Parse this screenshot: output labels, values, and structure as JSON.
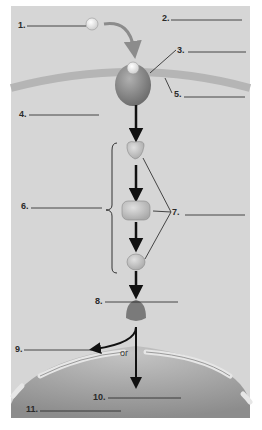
{
  "diagram": {
    "type": "cell signaling pathway worksheet",
    "labels": [
      {
        "num": "1.",
        "blank": ""
      },
      {
        "num": "2.",
        "blank": ""
      },
      {
        "num": "3.",
        "blank": ""
      },
      {
        "num": "4.",
        "blank": ""
      },
      {
        "num": "5.",
        "blank": ""
      },
      {
        "num": "6.",
        "blank": ""
      },
      {
        "num": "7.",
        "blank": ""
      },
      {
        "num": "8.",
        "blank": ""
      },
      {
        "num": "9.",
        "blank": ""
      },
      {
        "num": "10.",
        "blank": ""
      },
      {
        "num": "11.",
        "blank": ""
      }
    ],
    "or_text": "or",
    "colors": {
      "background": "#d6d6d6",
      "membrane": "#b5b5b5",
      "receptor": "#8a8a8a",
      "ligand": "#f2f2f2",
      "relay": "#bdbdbd",
      "response_molecule": "#7a7a7a",
      "nucleus": "#a8a8a8",
      "arrow": "#111111",
      "ligand_arrow": "#8c8c8c"
    }
  }
}
